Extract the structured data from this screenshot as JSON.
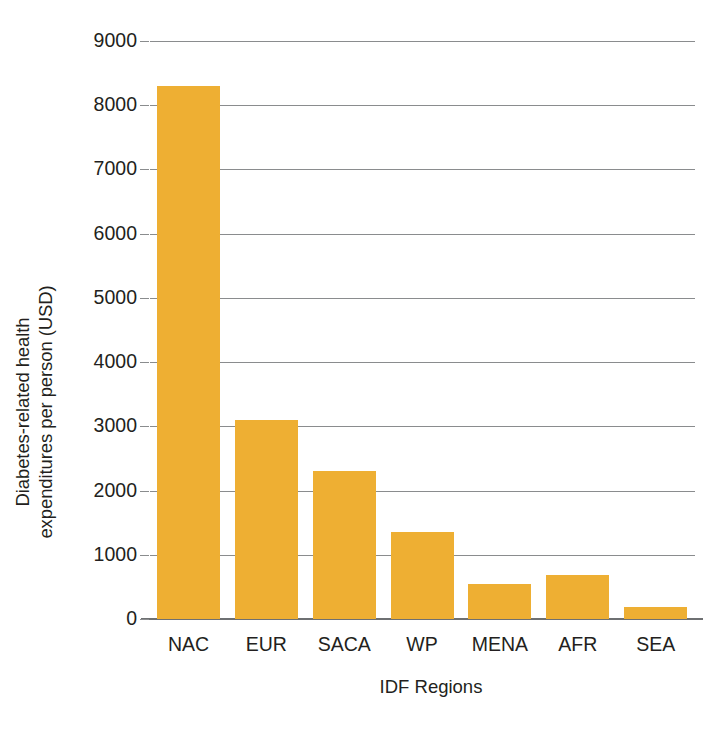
{
  "chart_data": {
    "type": "bar",
    "title": "",
    "subtitle": "",
    "xlabel": "IDF Regions",
    "ylabel": "Diabetes-related health expenditures per person (USD)",
    "ylabel_lines": [
      "Diabetes-related health",
      "expenditures per person (USD)"
    ],
    "categories": [
      "NAC",
      "EUR",
      "SACA",
      "WP",
      "MENA",
      "AFR",
      "SEA"
    ],
    "values": [
      8300,
      3100,
      2300,
      1350,
      550,
      680,
      180
    ],
    "ylim": [
      0,
      9000
    ],
    "ytick_values": [
      0,
      1000,
      2000,
      3000,
      4000,
      5000,
      6000,
      7000,
      8000,
      9000
    ],
    "ytick_labels": [
      "0",
      "1000",
      "2000",
      "3000",
      "4000",
      "5000",
      "6000",
      "7000",
      "8000",
      "9000"
    ],
    "grid": true,
    "grid_axis": "y",
    "legend": false,
    "legend_position": "none",
    "bar_color": "#eeaf33",
    "grid_color": "#8a8c8e",
    "axis_color": "#6e7072",
    "text_color": "#231f20",
    "background_color": "#ffffff"
  }
}
